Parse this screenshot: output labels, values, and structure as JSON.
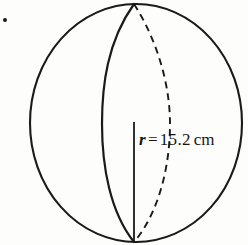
{
  "figure": {
    "name": "sphere-with-radius-diagram",
    "bullet_marker": "•",
    "stroke_color": "#1a1a1a",
    "background_color": "#fdfdfc",
    "label": {
      "symbol": "r",
      "equals": "=",
      "value": "15.2",
      "unit": "cm",
      "full_text": "r = 15.2 cm"
    },
    "geometry": {
      "sphere_outline": {
        "shape": "circle",
        "center_x": 136,
        "center_y": 123,
        "radius_x": 106,
        "radius_y": 119,
        "line_style": "solid"
      },
      "front_meridian": {
        "shape": "ellipse-arc",
        "line_style": "solid",
        "top_point_x": 134,
        "top_point_y": 4,
        "bottom_point_x": 134,
        "bottom_point_y": 242,
        "bulge_x": 102
      },
      "back_meridian": {
        "shape": "ellipse-arc",
        "line_style": "dashed",
        "top_point_x": 134,
        "top_point_y": 4,
        "bottom_point_x": 134,
        "bottom_point_y": 242,
        "bulge_x": 170
      },
      "radius_segment": {
        "shape": "line",
        "line_style": "solid",
        "x1": 134,
        "y1": 122,
        "x2": 134,
        "y2": 241
      }
    }
  }
}
